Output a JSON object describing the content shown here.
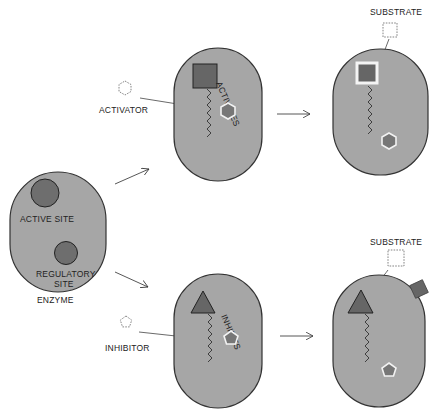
{
  "colors": {
    "enzyme_fill": "#a6a6a6",
    "enzyme_stroke": "#333333",
    "site_fill": "#6e6e6e",
    "site_stroke": "#222222",
    "hexagon_fill": "#777777",
    "background": "#ffffff"
  },
  "enzyme": {
    "label": "ENZYME",
    "active_site_label": "ACTIVE SITE",
    "regulatory_site_label_line1": "REGULATORY",
    "regulatory_site_label_line2": "SITE"
  },
  "activation_path": {
    "effector_label": "ACTIVATOR",
    "effector_shape": "hexagon-dashed-icon",
    "action_label": "ACTIVATES",
    "substrate_label": "SUBSTRATE"
  },
  "inhibition_path": {
    "effector_label": "INHIBITOR",
    "effector_shape": "pentagon-dashed-icon",
    "action_label": "INHIBITS",
    "substrate_label": "SUBSTRATE"
  }
}
